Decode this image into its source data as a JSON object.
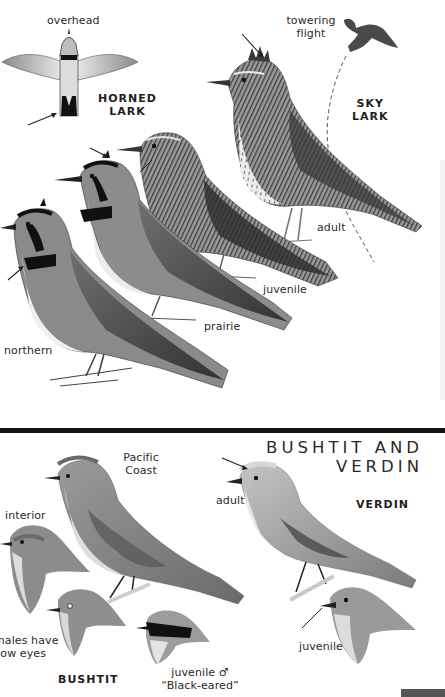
{
  "page": {
    "background": "#ffffff",
    "divider_color": "#121212"
  },
  "top_section": {
    "species": [
      {
        "name_line1": "HORNED",
        "name_line2": "LARK",
        "views": [
          {
            "label": "overhead"
          },
          {
            "label": "prairie"
          },
          {
            "label": "juvenile"
          },
          {
            "label": "northern"
          }
        ]
      },
      {
        "name_line1": "SKY",
        "name_line2": "LARK",
        "views": [
          {
            "label_line1": "towering",
            "label_line2": "flight"
          },
          {
            "label": "adult"
          }
        ]
      }
    ]
  },
  "bottom_section": {
    "title_line1": "BUSHTIT AND",
    "title_line2": "VERDIN",
    "species": [
      {
        "name": "BUSHTIT",
        "views": [
          {
            "label_line1": "Pacific",
            "label_line2": "Coast"
          },
          {
            "label": "interior"
          },
          {
            "label_line1": "males have",
            "label_line2": "llow eyes",
            "note": "text cut off at left page edge"
          },
          {
            "label_line1": "juvenile ♂",
            "label_line2": "“Black-eared”"
          }
        ]
      },
      {
        "name": "VERDIN",
        "views": [
          {
            "label": "adult"
          },
          {
            "label": "juvenile"
          }
        ]
      }
    ]
  },
  "icons": {
    "pointer_arrow": "arrow",
    "male_symbol": "♂"
  }
}
